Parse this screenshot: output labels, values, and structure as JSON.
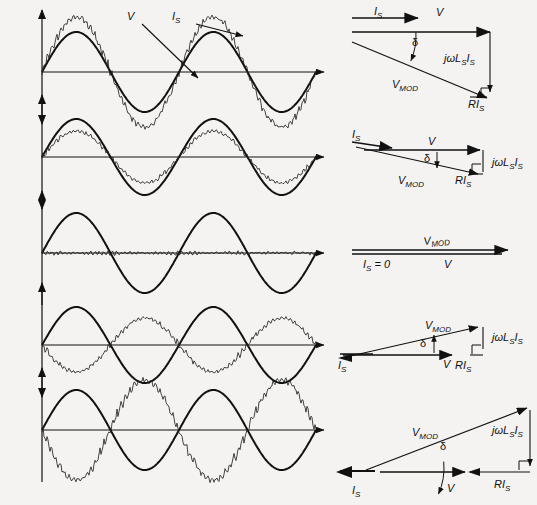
{
  "figure": {
    "background_color": "#f4f3f1",
    "stroke_color": "#111111",
    "rows": [
      {
        "id": "row-1",
        "waveform": {
          "axis_y": 72,
          "voltage_label": "V",
          "current_label": "I",
          "current_sub": "S",
          "voltage_amplitude": 40,
          "current_amplitude": 55,
          "current_phase_deg": 0,
          "ripple_amplitude": 4.5,
          "cycles": 2
        },
        "phasor": {
          "labels": {
            "current": "I",
            "current_sub": "S",
            "voltage": "V",
            "vmod": "V",
            "vmod_sub": "MOD",
            "reactance": "jωL",
            "reactance_sub": "S",
            "reactance_tail": "I",
            "reactance_tail_sub": "S",
            "resistance": "RI",
            "resistance_sub": "S",
            "delta": "δ"
          },
          "is_direction": "right",
          "delta_deg": 35,
          "variant": "large-lag"
        }
      },
      {
        "id": "row-2",
        "waveform": {
          "axis_y": 157,
          "voltage_amplitude": 38,
          "current_amplitude": 26,
          "current_phase_deg": 0,
          "ripple_amplitude": 2.5,
          "cycles": 2
        },
        "phasor": {
          "labels": {
            "current": "I",
            "current_sub": "S",
            "voltage": "V",
            "vmod": "V",
            "vmod_sub": "MOD",
            "reactance": "jωL",
            "reactance_sub": "S",
            "reactance_tail": "I",
            "reactance_tail_sub": "S",
            "resistance": "RI",
            "resistance_sub": "S",
            "delta": "δ"
          },
          "is_direction": "right",
          "delta_deg": 14,
          "variant": "small-lag"
        }
      },
      {
        "id": "row-3",
        "waveform": {
          "axis_y": 253,
          "voltage_amplitude": 40,
          "current_amplitude": 0,
          "current_phase_deg": 0,
          "ripple_amplitude": 2.0,
          "cycles": 2
        },
        "phasor": {
          "labels": {
            "current_zero": "I",
            "current_zero_sub": "S",
            "current_zero_tail": " = 0",
            "voltage": "V",
            "vmod": "V",
            "vmod_sub": "MOD"
          },
          "is_direction": "none",
          "delta_deg": 0,
          "variant": "zero-current"
        }
      },
      {
        "id": "row-4",
        "waveform": {
          "axis_y": 345,
          "voltage_amplitude": 38,
          "current_amplitude": 27,
          "current_phase_deg": 180,
          "ripple_amplitude": 3.0,
          "cycles": 2
        },
        "phasor": {
          "labels": {
            "current": "I",
            "current_sub": "S",
            "voltage": "V",
            "vmod": "V",
            "vmod_sub": "MOD",
            "reactance": "jωL",
            "reactance_sub": "S",
            "reactance_tail": "I",
            "reactance_tail_sub": "S",
            "resistance": "RI",
            "resistance_sub": "S",
            "delta": "δ"
          },
          "is_direction": "left",
          "delta_deg": 13,
          "variant": "small-lead"
        }
      },
      {
        "id": "row-5",
        "waveform": {
          "axis_y": 430,
          "voltage_amplitude": 40,
          "current_amplitude": 50,
          "current_phase_deg": 180,
          "ripple_amplitude": 5.0,
          "cycles": 2
        },
        "phasor": {
          "labels": {
            "current": "I",
            "current_sub": "S",
            "voltage": "V",
            "vmod": "V",
            "vmod_sub": "MOD",
            "reactance": "jωL",
            "reactance_sub": "S",
            "reactance_tail": "I",
            "reactance_tail_sub": "S",
            "resistance": "RI",
            "resistance_sub": "S",
            "delta": "δ"
          },
          "is_direction": "left",
          "delta_deg": 30,
          "variant": "large-lead"
        }
      }
    ],
    "annotations": {
      "v_callout": "V",
      "is_callout": "I",
      "is_callout_sub": "S"
    }
  }
}
